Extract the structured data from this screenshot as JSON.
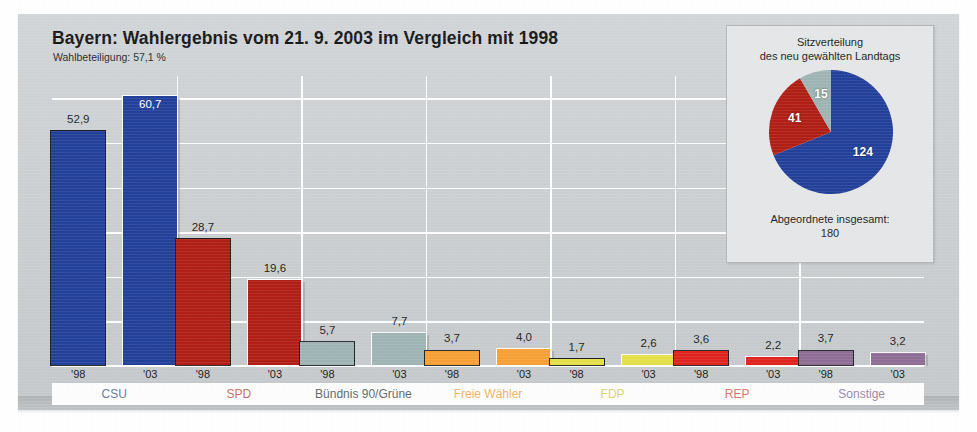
{
  "header": {
    "title": "Bayern: Wahlergebnis vom 21. 9. 2003 im Vergleich mit 1998",
    "subtitle": "Wahlbeteiligung: 57,1 %"
  },
  "inset": {
    "title_line1": "Sitzverteilung",
    "title_line2": "des neu gewählten Landtags",
    "caption_line1": "Abgeordnete insgesamt:",
    "caption_line2": "180"
  },
  "year_labels": {
    "old": "'98",
    "new": "'03"
  },
  "chart_data": {
    "type": "bar",
    "title": "Bayern: Wahlergebnis vom 21. 9. 2003 im Vergleich mit 1998",
    "subtitle": "Wahlbeteiligung: 57,1 %",
    "xlabel": "",
    "ylabel": "",
    "ylim": [
      0,
      65
    ],
    "grid": true,
    "grid_step": 10,
    "legend": "none",
    "categories": [
      "CSU",
      "SPD",
      "Bündnis 90/Grüne",
      "Freie Wähler",
      "FDP",
      "REP",
      "Sonstige"
    ],
    "series": [
      {
        "name": "'98",
        "values": [
          52.9,
          28.7,
          5.7,
          3.7,
          1.7,
          3.6,
          3.7
        ],
        "value_labels": [
          "52,9",
          "28,7",
          "5,7",
          "3,7",
          "1,7",
          "3,6",
          "3,7"
        ]
      },
      {
        "name": "'03",
        "values": [
          60.7,
          19.6,
          7.7,
          4.0,
          2.6,
          2.2,
          3.2
        ],
        "value_labels": [
          "60,7",
          "19,6",
          "7,7",
          "4,0",
          "2,6",
          "2,2",
          "3,2"
        ]
      }
    ],
    "category_colors": [
      "#23409a",
      "#b01f16",
      "#9fb4b4",
      "#f7a035",
      "#e4e04a",
      "#e02420",
      "#8f6e96"
    ],
    "label_colors": [
      "#6a7a96",
      "#c07068",
      "#5c6a6a",
      "#f0b265",
      "#d8d37a",
      "#e0736e",
      "#9e86a6"
    ]
  },
  "pie_data": {
    "type": "pie",
    "title": "Sitzverteilung des neu gewählten Landtags",
    "caption": "Abgeordnete insgesamt: 180",
    "total": 180,
    "labels": [
      "CSU",
      "SPD",
      "Bündnis 90/Grüne"
    ],
    "values": [
      124,
      41,
      15
    ],
    "value_labels": [
      "124",
      "41",
      "15"
    ],
    "colors": [
      "#23409a",
      "#b01f16",
      "#9fb4b4"
    ]
  }
}
